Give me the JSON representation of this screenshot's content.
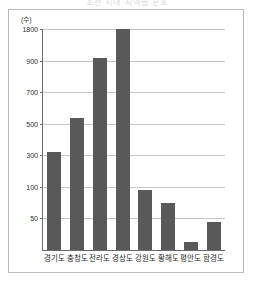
{
  "chart_data": {
    "type": "bar",
    "title": "조선 시대 지역별 분포",
    "unit_label": "(수)",
    "xlabel": "",
    "ylabel": "",
    "categories": [
      "경기도",
      "충청도",
      "전라도",
      "경상도",
      "강원도",
      "황해도",
      "평안도",
      "함경도"
    ],
    "values": [
      320,
      535,
      960,
      1810,
      95,
      75,
      12,
      45
    ],
    "yticks": [
      50,
      100,
      300,
      500,
      700,
      900,
      1800
    ],
    "ytick_labels": [
      "50",
      "100",
      "300",
      "500",
      "700",
      "900",
      "1800"
    ],
    "ylim": [
      0,
      1800
    ],
    "grid": true,
    "legend": "none",
    "bar_color": "#595959",
    "grid_color": "#c6c6c6",
    "axis_color": "#6b6b6b",
    "frame_color": "#b9b9b9"
  }
}
